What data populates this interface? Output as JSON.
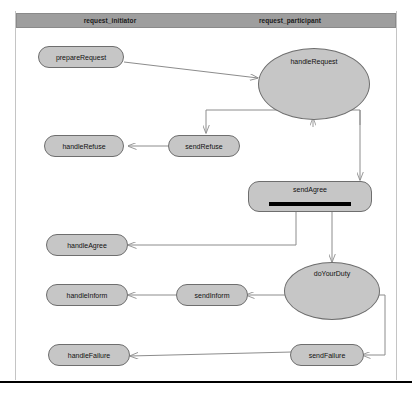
{
  "diagram": {
    "colors": {
      "node_fill": "#c6c6c6",
      "node_stroke": "#6e6e6e",
      "lane_header_fill": "#9e9e9e",
      "connector": "#8c8c8c",
      "fork_bar": "#000000",
      "frame": "#b4b4b4"
    },
    "lanes": [
      {
        "id": "initiator",
        "label": "request_initiator"
      },
      {
        "id": "participant",
        "label": "request_participant"
      }
    ],
    "nodes": [
      {
        "id": "prepareRequest",
        "label": "prepareRequest",
        "lane": "initiator",
        "shape": "action"
      },
      {
        "id": "handleRequest",
        "label": "handleRequest",
        "lane": "participant",
        "shape": "decision-oval"
      },
      {
        "id": "sendRefuse",
        "label": "sendRefuse",
        "lane": "participant",
        "shape": "action"
      },
      {
        "id": "handleRefuse",
        "label": "handleRefuse",
        "lane": "initiator",
        "shape": "action"
      },
      {
        "id": "sendAgree",
        "label": "sendAgree",
        "lane": "participant",
        "shape": "action-fork"
      },
      {
        "id": "handleAgree",
        "label": "handleAgree",
        "lane": "initiator",
        "shape": "action"
      },
      {
        "id": "doYourDuty",
        "label": "doYourDuty",
        "lane": "participant",
        "shape": "decision-oval"
      },
      {
        "id": "sendInform",
        "label": "sendInform",
        "lane": "participant",
        "shape": "action"
      },
      {
        "id": "handleInform",
        "label": "handleInform",
        "lane": "initiator",
        "shape": "action"
      },
      {
        "id": "sendFailure",
        "label": "sendFailure",
        "lane": "participant",
        "shape": "action"
      },
      {
        "id": "handleFailure",
        "label": "handleFailure",
        "lane": "initiator",
        "shape": "action"
      }
    ],
    "edges": [
      {
        "from": "prepareRequest",
        "to": "handleRequest"
      },
      {
        "from": "handleRequest",
        "to": "sendRefuse"
      },
      {
        "from": "sendRefuse",
        "to": "handleRefuse"
      },
      {
        "from": "handleRequest",
        "to": "sendAgree"
      },
      {
        "from": "sendAgree",
        "to": "handleAgree"
      },
      {
        "from": "sendAgree",
        "to": "doYourDuty"
      },
      {
        "from": "doYourDuty",
        "to": "sendInform"
      },
      {
        "from": "sendInform",
        "to": "handleInform"
      },
      {
        "from": "doYourDuty",
        "to": "sendFailure"
      },
      {
        "from": "sendFailure",
        "to": "handleFailure"
      }
    ]
  }
}
